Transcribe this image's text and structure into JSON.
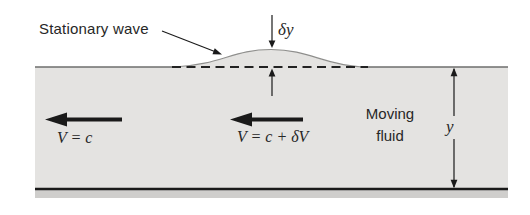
{
  "figure": {
    "labels": {
      "stationary_wave": "Stationary wave",
      "delta_y": "δy",
      "velocity_left": "V = c",
      "velocity_right": "V = c + δV",
      "moving_fluid_line1": "Moving",
      "moving_fluid_line2": "fluid",
      "depth": "y"
    }
  },
  "colors": {
    "page_bg": "#ffffff",
    "fluid": "#e4e3e1",
    "bed_strip": "#cfcecc",
    "ink": "#1a1a1a",
    "surface_line": "#6e6e6c",
    "wave_outline": "#8f8f8d",
    "dash_line": "#222222",
    "text": "#272727"
  }
}
